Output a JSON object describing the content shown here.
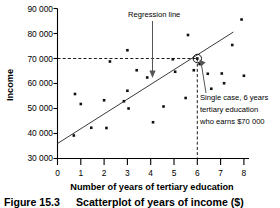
{
  "chart_data": {
    "type": "scatter",
    "title": "",
    "xlabel": "Number of years of tertiary education",
    "ylabel": "Income",
    "xlim": [
      0,
      8
    ],
    "ylim": [
      30000,
      90000
    ],
    "xticks": [
      "0",
      "1",
      "2",
      "3",
      "4",
      "5",
      "6",
      "7",
      "8"
    ],
    "yticks": [
      "30 000",
      "40 000",
      "50 000",
      "60 000",
      "70 000",
      "80 000",
      "90 000"
    ],
    "grid": false,
    "legend": "none",
    "points": [
      {
        "x": 0.7,
        "y": 39200
      },
      {
        "x": 0.75,
        "y": 55800
      },
      {
        "x": 1.0,
        "y": 51800
      },
      {
        "x": 1.45,
        "y": 42300
      },
      {
        "x": 2.0,
        "y": 53300
      },
      {
        "x": 2.1,
        "y": 42200
      },
      {
        "x": 2.25,
        "y": 68800
      },
      {
        "x": 2.85,
        "y": 52900
      },
      {
        "x": 3.0,
        "y": 73300
      },
      {
        "x": 3.0,
        "y": 57100
      },
      {
        "x": 3.05,
        "y": 50000
      },
      {
        "x": 3.4,
        "y": 65300
      },
      {
        "x": 3.85,
        "y": 62400
      },
      {
        "x": 4.1,
        "y": 44500
      },
      {
        "x": 4.55,
        "y": 50800
      },
      {
        "x": 4.95,
        "y": 69700
      },
      {
        "x": 5.05,
        "y": 64700
      },
      {
        "x": 5.5,
        "y": 54200
      },
      {
        "x": 5.6,
        "y": 79400
      },
      {
        "x": 5.85,
        "y": 65300
      },
      {
        "x": 6.0,
        "y": 70000
      },
      {
        "x": 6.1,
        "y": 67800
      },
      {
        "x": 6.45,
        "y": 63900
      },
      {
        "x": 6.6,
        "y": 57900
      },
      {
        "x": 7.05,
        "y": 64000
      },
      {
        "x": 7.15,
        "y": 60100
      },
      {
        "x": 7.5,
        "y": 75400
      },
      {
        "x": 7.9,
        "y": 85600
      },
      {
        "x": 8.0,
        "y": 63100
      }
    ],
    "regression_line": {
      "x_start": 0,
      "y_start": 36000,
      "x_end": 7.55,
      "y_end": 80600
    },
    "highlighted_point": {
      "x": 6,
      "y": 70000
    },
    "guide_lines": {
      "horizontal_y": 70000,
      "vertical_x": 6
    },
    "annotations": [
      {
        "name": "regression-line",
        "text": "Regression line",
        "lines": [
          "Regression line"
        ]
      },
      {
        "name": "single-case",
        "text": "Single case, 6 years tertiary education who earns $70 000",
        "lines": [
          "Single case, 6 years",
          "tertiary education",
          "who earns $70 000"
        ]
      }
    ]
  },
  "caption": {
    "number": "Figure 15.3",
    "text": "Scatterplot of years of income ($)"
  }
}
